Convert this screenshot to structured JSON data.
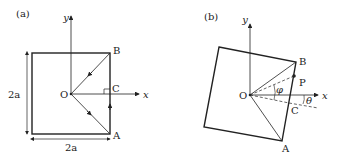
{
  "panel_a": {
    "tag": "(a)",
    "axis_x": "x",
    "axis_y": "y",
    "origin": "O",
    "point_a": "A",
    "point_b": "B",
    "point_c": "C",
    "height_label": "2a",
    "width_label": "2a"
  },
  "panel_b": {
    "tag": "(b)",
    "axis_x": "x",
    "axis_y": "y",
    "origin": "O",
    "point_a": "A",
    "point_b": "B",
    "point_c": "C",
    "point_p": "P",
    "angle_phi": "φ",
    "angle_theta": "θ"
  },
  "colors": {
    "stroke": "#222222",
    "background": "#ffffff"
  }
}
